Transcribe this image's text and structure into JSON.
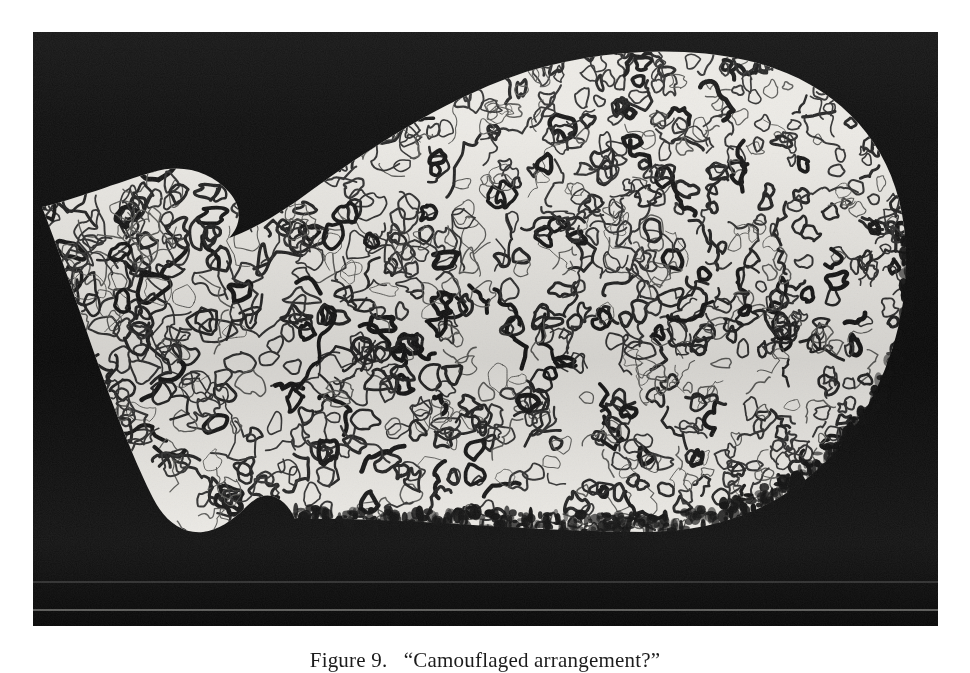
{
  "figure": {
    "caption_label": "Figure 9.",
    "caption_title": "“Camouflaged arrangement?”",
    "caption_full": "Figure 9. “Camouflaged arrangement?”",
    "medium": "halftone black-and-white photograph",
    "colors": {
      "background_black": "#080808",
      "shape_white": "#ededea",
      "line_black": "#141414",
      "page_white": "#ffffff",
      "caption_ink": "#1c1c1c"
    },
    "plate": {
      "x": 33,
      "y": 32,
      "width": 905,
      "height": 594
    },
    "pattern": {
      "name": "vermiculate-squiggles",
      "count": 1400,
      "description": "worm-like closed loops and meanders of varying stroke weight"
    }
  }
}
